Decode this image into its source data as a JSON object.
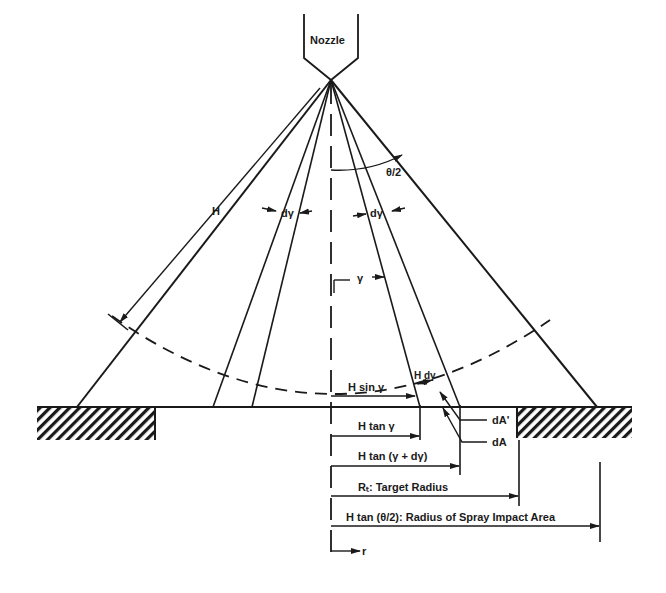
{
  "diagram": {
    "type": "spray-nozzle-geometry",
    "nozzle": {
      "label": "Nozzle"
    },
    "labels": {
      "H": "H",
      "half_angle": "θ/2",
      "d_gamma_left": "dγ",
      "d_gamma_right": "dγ",
      "gamma": "γ",
      "H_d_gamma": "H dγ",
      "H_sin_gamma": "H sin γ",
      "dA_prime": "dA'",
      "dA": "dA",
      "H_tan_gamma": "H tan γ",
      "H_tan_gamma_dgamma": "H tan (γ + dγ)",
      "target_radius": "Rₜ:  Target Radius",
      "spray_radius": "H tan (θ/2):  Radius of Spray Impact Area",
      "r": "r"
    },
    "colors": {
      "ink": "#1a1a1a",
      "background": "#ffffff"
    }
  }
}
